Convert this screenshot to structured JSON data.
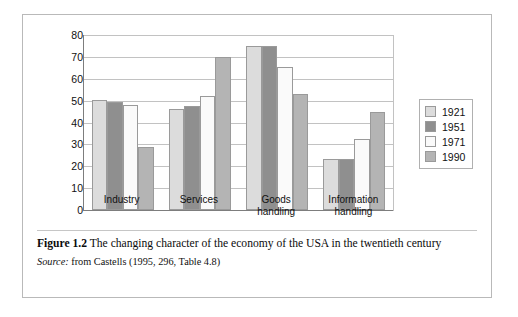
{
  "figure": {
    "caption_bold": "Figure 1.2",
    "caption_text": "The changing character of the economy of the USA in the twentieth century",
    "source_label": "Source:",
    "source_text": "from Castells (1995, 296, Table 4.8)"
  },
  "colors": {
    "series_1921": "#dcdcdc",
    "series_1951": "#8f8f8f",
    "series_1971": "#fafafa",
    "series_1990": "#b4b4b4",
    "bar_outline": "#9a9a9a",
    "gridline": "#c2c2c2",
    "axis": "#7d7d7d",
    "frame": "#b9b9b9",
    "text": "#111111"
  },
  "chart_data": {
    "type": "bar",
    "title": "",
    "xlabel": "",
    "ylabel": "",
    "ylim": [
      0,
      80
    ],
    "yticks": [
      0,
      10,
      20,
      30,
      40,
      50,
      60,
      70,
      80
    ],
    "ytick_labels": [
      "0",
      "10",
      "20",
      "30",
      "40",
      "50",
      "60",
      "70",
      "80"
    ],
    "grid": true,
    "legend_position": "right",
    "categories": [
      "Industry",
      "Services",
      "Goods\nhandling",
      "Information\nhandling"
    ],
    "category_labels": [
      "Industry",
      "Services",
      "Goods handling",
      "Information handling"
    ],
    "series": [
      {
        "name": "1921",
        "color": "#dcdcdc",
        "values": [
          50.5,
          46.0,
          75.0,
          23.5
        ]
      },
      {
        "name": "1951",
        "color": "#8f8f8f",
        "values": [
          49.5,
          47.5,
          75.0,
          23.5
        ]
      },
      {
        "name": "1971",
        "color": "#fafafa",
        "values": [
          48.0,
          52.0,
          65.5,
          32.5
        ]
      },
      {
        "name": "1990",
        "color": "#b4b4b4",
        "values": [
          29.0,
          70.0,
          53.0,
          45.0
        ]
      }
    ]
  }
}
